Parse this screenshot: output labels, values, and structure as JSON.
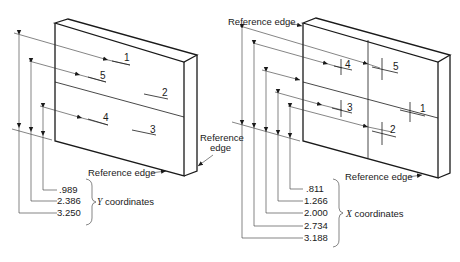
{
  "left_figure": {
    "hole_labels": [
      "1",
      "5",
      "2",
      "4",
      "3"
    ],
    "reference_edge_bottom": "Reference edge",
    "reference_edge_side_line1": "Reference",
    "reference_edge_side_line2": "edge",
    "dimensions": [
      ".989",
      "2.386",
      "3.250"
    ],
    "axis_label_var": "Y",
    "axis_label_text": " coordinates"
  },
  "right_figure": {
    "hole_labels": [
      "4",
      "5",
      "3",
      "1",
      "2"
    ],
    "reference_edge_top": "Reference edge",
    "reference_edge_bottom": "Reference edge",
    "dimensions": [
      ".811",
      "1.266",
      "2.000",
      "2.734",
      "3.188"
    ],
    "axis_label_var": "X",
    "axis_label_text": " coordinates"
  }
}
